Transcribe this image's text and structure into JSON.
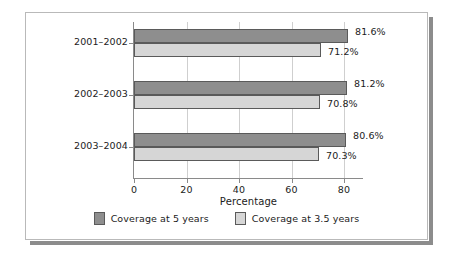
{
  "chart_data": {
    "type": "bar",
    "orientation": "horizontal",
    "title": "",
    "subtitle": "",
    "xlabel": "Percentage",
    "ylabel": "",
    "categories": [
      "2001–2002",
      "2002–2003",
      "2003–2004"
    ],
    "series": [
      {
        "name": "Coverage at 5 years",
        "color": "#8e8e8e",
        "values": [
          81.6,
          81.2,
          80.6
        ],
        "value_labels": [
          "81.6%",
          "81.2%",
          "80.6%"
        ]
      },
      {
        "name": "Coverage at 3.5 years",
        "color": "#d6d6d6",
        "values": [
          71.2,
          70.8,
          70.3
        ],
        "value_labels": [
          "71.2%",
          "70.8%",
          "70.3%"
        ]
      }
    ],
    "xlim": [
      0,
      87.2
    ],
    "xticks": [
      0,
      20,
      40,
      60,
      80
    ],
    "xtick_labels": [
      "0",
      "20",
      "40",
      "60",
      "80"
    ],
    "grid": "vertical",
    "legend_position": "bottom"
  },
  "legend": {
    "items": [
      {
        "label": "Coverage at 5 years",
        "color": "#8e8e8e"
      },
      {
        "label": "Coverage at 3.5 years",
        "color": "#d6d6d6"
      }
    ]
  },
  "axis": {
    "x_title": "Percentage"
  },
  "style": {
    "frame_border": "#b9b9b9",
    "shadow": "#8c8c8c",
    "gridline": "#cfcfcf",
    "axis_line": "#8a8a8a",
    "text": "#1b1b1b",
    "background": "#ffffff"
  }
}
